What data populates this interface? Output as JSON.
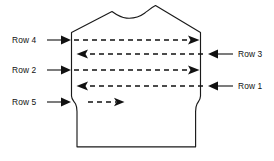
{
  "figure": {
    "type": "knitting-row-direction-diagram",
    "background_color": "#ffffff",
    "line_color": "#111111"
  },
  "labels": {
    "row4": "Row 4",
    "row3": "Row 3",
    "row2": "Row 2",
    "row1": "Row 1",
    "row5": "Row 5"
  },
  "rows": [
    {
      "id": "row4",
      "label": "Row 4",
      "label_side": "left",
      "knit_direction": "right",
      "y": 40,
      "dash_start_x": 74,
      "dash_end_x": 196,
      "full_width": true
    },
    {
      "id": "row3",
      "label": "Row 3",
      "label_side": "right",
      "knit_direction": "left",
      "y": 54,
      "dash_start_x": 203,
      "dash_end_x": 80,
      "full_width": true
    },
    {
      "id": "row2",
      "label": "Row 2",
      "label_side": "left",
      "knit_direction": "right",
      "y": 70,
      "dash_start_x": 74,
      "dash_end_x": 196,
      "full_width": true
    },
    {
      "id": "row1",
      "label": "Row 1",
      "label_side": "right",
      "knit_direction": "left",
      "y": 86,
      "dash_start_x": 203,
      "dash_end_x": 80,
      "full_width": true
    },
    {
      "id": "row5",
      "label": "Row 5",
      "label_side": "left",
      "knit_direction": "right",
      "y": 102,
      "dash_start_x": 88,
      "dash_end_x": 124,
      "full_width": false
    }
  ],
  "pointers": [
    {
      "id": "row4",
      "side": "left",
      "label_x": 12,
      "text_y": 43,
      "line_x1": 47,
      "line_x2": 66,
      "tip_x": 70,
      "y": 40
    },
    {
      "id": "row2",
      "side": "left",
      "label_x": 12,
      "text_y": 73,
      "line_x1": 47,
      "line_x2": 66,
      "tip_x": 70,
      "y": 70
    },
    {
      "id": "row5",
      "side": "left",
      "label_x": 12,
      "text_y": 105,
      "line_x1": 47,
      "line_x2": 66,
      "tip_x": 70,
      "y": 102
    },
    {
      "id": "row3",
      "side": "right",
      "label_x": 238,
      "text_y": 57,
      "line_x1": 229,
      "line_x2": 216,
      "tip_x": 208,
      "y": 54
    },
    {
      "id": "row1",
      "side": "right",
      "label_x": 238,
      "text_y": 89,
      "line_x1": 229,
      "line_x2": 216,
      "tip_x": 208,
      "y": 86
    }
  ],
  "outline": {
    "description": "front panel of a sweater: sloped shoulders rising to a dipped neckline, straight side seams, armhole notch step-ins, straight lower body, flat hem",
    "neck_left_shoulder_x": 114,
    "neck_right_shoulder_x": 158,
    "hem_y": 147
  }
}
